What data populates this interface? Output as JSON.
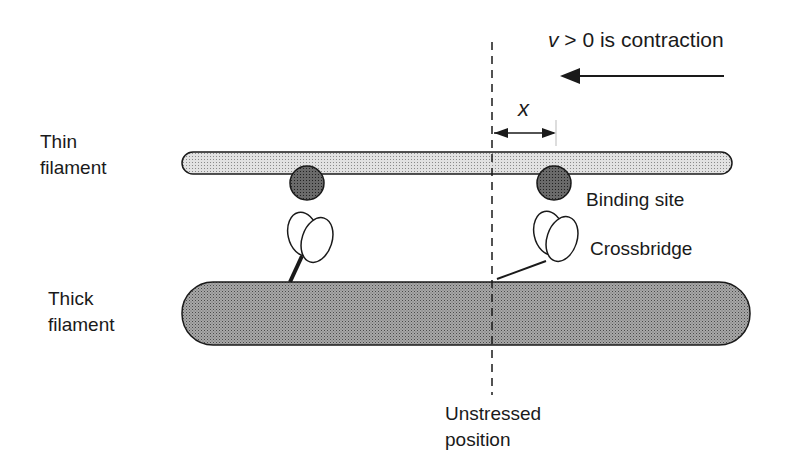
{
  "diagram": {
    "labels": {
      "velocity_var": "v",
      "velocity_rest": "> 0 is contraction",
      "x_var": "x",
      "thin_line1": "Thin",
      "thin_line2": "filament",
      "thick_line1": "Thick",
      "thick_line2": "filament",
      "binding_site": "Binding site",
      "crossbridge": "Crossbridge",
      "unstressed_line1": "Unstressed",
      "unstressed_line2": "position"
    },
    "colors": {
      "thin_fill": "#d4d4d4",
      "thick_fill": "#9a9a9a",
      "site_fill": "#5a5a5a",
      "stroke": "#1a1a1a"
    }
  }
}
